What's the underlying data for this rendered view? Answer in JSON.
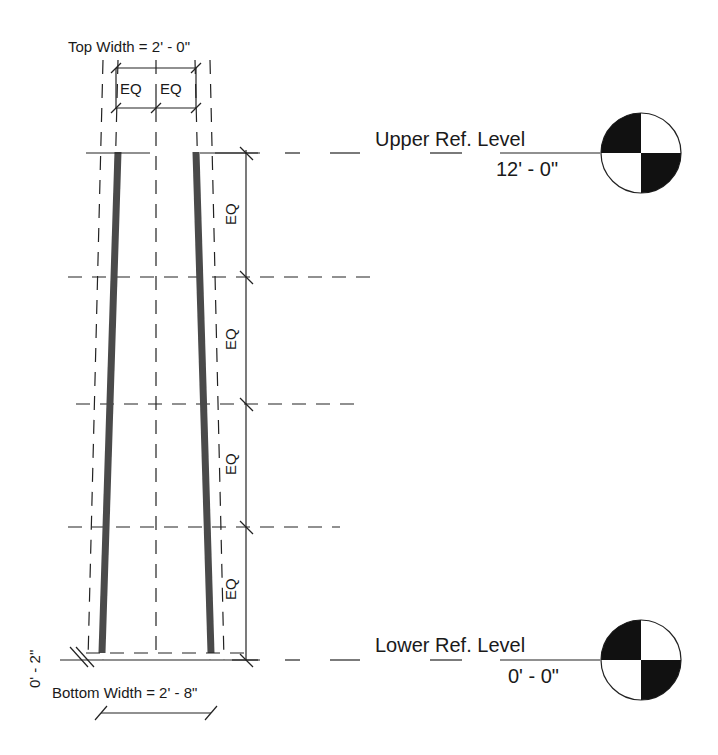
{
  "drawing": {
    "top_width": {
      "label": "Top Width = 2' - 0\"",
      "segments": [
        "EQ",
        "EQ"
      ]
    },
    "bottom_width": {
      "label": "Bottom Width = 2' - 8\""
    },
    "offset_dimension": {
      "label": "0' - 2\""
    },
    "vertical_dimension": {
      "segments": [
        "EQ",
        "EQ",
        "EQ",
        "EQ"
      ]
    },
    "levels": [
      {
        "name": "Upper Ref. Level",
        "elevation": "12' - 0\""
      },
      {
        "name": "Lower Ref. Level",
        "elevation": "0' - 0\""
      }
    ],
    "colors": {
      "line": "#222222",
      "wall": "#4a4a4a",
      "level_marker_fill": "#111111",
      "background": "#ffffff"
    }
  }
}
